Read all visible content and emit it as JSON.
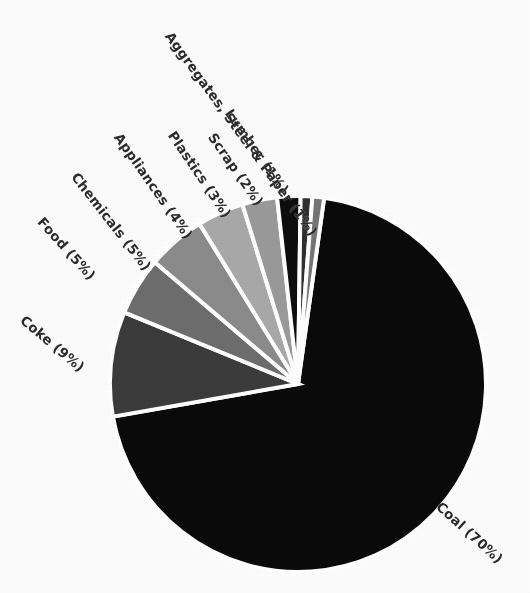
{
  "chart_data": {
    "type": "pie",
    "title": "",
    "subtitle": "",
    "xlabel": "",
    "ylabel": "",
    "legend_position": "none",
    "labels_rotated_radially": true,
    "start_angle_deg": -82,
    "direction": "clockwise",
    "center": {
      "x": 298,
      "y": 384
    },
    "radius": 188,
    "gap_color": "#ffffff",
    "categories": [
      "Coal",
      "Coke",
      "Food",
      "Chemicals",
      "Appliances",
      "Plastics",
      "Scrap",
      "Lumber",
      "Aggregates, Steel & Paper"
    ],
    "values": [
      70,
      9,
      5,
      5,
      4,
      3,
      2,
      1,
      1
    ],
    "units": "%",
    "slices": [
      {
        "label": "Coal (70%)",
        "name": "Coal",
        "value": 70,
        "color": "#0a0a0a",
        "label_x": 438,
        "label_y": 498,
        "label_rot": 42
      },
      {
        "label": "Coke (9%)",
        "name": "Coke",
        "value": 9,
        "color": "#3b3b3b",
        "label_x": 22,
        "label_y": 312,
        "label_rot": 40
      },
      {
        "label": "Food (5%)",
        "name": "Food",
        "value": 5,
        "color": "#6d6d6d",
        "label_x": 40,
        "label_y": 213,
        "label_rot": 48
      },
      {
        "label": "Chemicals (5%)",
        "name": "Chemicals",
        "value": 5,
        "color": "#8b8b8b",
        "label_x": 74,
        "label_y": 168,
        "label_rot": 52
      },
      {
        "label": "Appliances (4%)",
        "name": "Appliances",
        "value": 4,
        "color": "#a9a9a9",
        "label_x": 117,
        "label_y": 128,
        "label_rot": 55
      },
      {
        "label": "Plastics (3%)",
        "name": "Plastics",
        "value": 3,
        "color": "#9a9a9a",
        "label_x": 171,
        "label_y": 126,
        "label_rot": 56
      },
      {
        "label": "Scrap (2%)",
        "name": "Scrap",
        "value": 2,
        "color": "#0d0d0d",
        "label_x": 211,
        "label_y": 128,
        "label_rot": 55
      },
      {
        "label": "Lumber (1%)",
        "name": "Lumber",
        "value": 1,
        "color": "#2f2f2f",
        "label_x": 228,
        "label_y": 104,
        "label_rot": 55
      },
      {
        "label": "Aggregates, Steel & Paper (1%)",
        "name": "Aggregates, Steel & Paper",
        "value": 1,
        "color": "#757575",
        "label_x": 168,
        "label_y": 27,
        "label_rot": 54
      }
    ]
  },
  "figure": {
    "background": "#fdfdfd",
    "text_color": "#2b2b2b"
  }
}
